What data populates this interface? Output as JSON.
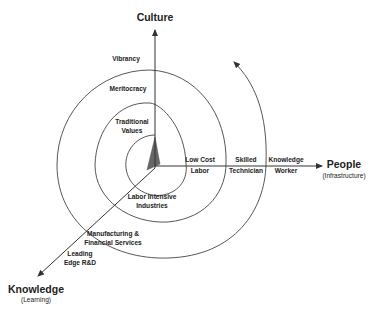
{
  "axes": {
    "culture": {
      "label": "Culture"
    },
    "people": {
      "label": "People",
      "sublabel": "(Infrastructure)"
    },
    "knowledge": {
      "label": "Knowledge",
      "sublabel": "(Learning)"
    }
  },
  "culture_stages": [
    {
      "line1": "Vibrancy"
    },
    {
      "line1": "Meritocracy"
    },
    {
      "line1": "Traditional",
      "line2": "Values"
    }
  ],
  "people_stages": [
    {
      "line1": "Low Cost",
      "line2": "Labor"
    },
    {
      "line1": "Skilled",
      "line2": "Technician"
    },
    {
      "line1": "Knowledge",
      "line2": "Worker"
    }
  ],
  "knowledge_stages": [
    {
      "line1": "Labor Intensive",
      "line2": "Industries"
    },
    {
      "line1": "Manufacturing &",
      "line2": "Financial Services"
    },
    {
      "line1": "Leading",
      "line2": "Edge R&D"
    }
  ],
  "colors": {
    "line": "#333333",
    "wedge": "#666666",
    "text": "#222222"
  }
}
